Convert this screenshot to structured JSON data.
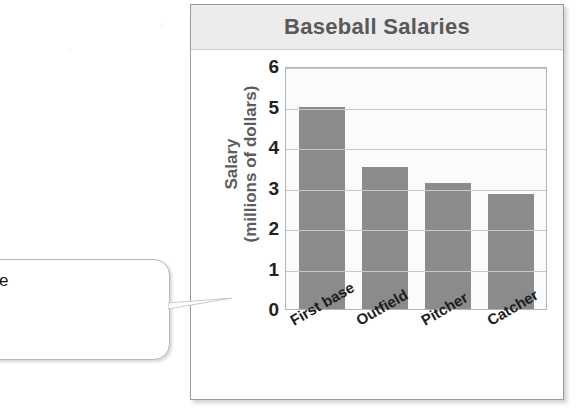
{
  "page": {
    "background_color": "#ffffff"
  },
  "chart_card": {
    "title": "Baseball Salaries",
    "title_color": "#59595b",
    "band_color": "#ececec",
    "border_color": "#9a9a9a"
  },
  "callout": {
    "line1": "propriate scale",
    "line2": "e data is 0 to",
    "line3": "lion.",
    "clipped": "true"
  },
  "chart_data": {
    "type": "bar",
    "title": "Baseball Salaries",
    "categories": [
      "First base",
      "Outfield",
      "Pitcher",
      "Catcher"
    ],
    "values": [
      5.0,
      3.5,
      3.1,
      2.85
    ],
    "xlabel": "",
    "ylabel": "Salary (millions of dollars)",
    "ylabel_line1": "Salary",
    "ylabel_line2": "(millions of dollars)",
    "ylim": [
      0,
      6
    ],
    "yticks": [
      6,
      5,
      4,
      3,
      2,
      1,
      0
    ],
    "ytick_labels": [
      "6",
      "5",
      "4",
      "3",
      "2",
      "1",
      "0"
    ],
    "grid": "horizontal",
    "legend": "none",
    "bar_color": "#8b8b8b",
    "plot_background": "#fbfbfb"
  }
}
